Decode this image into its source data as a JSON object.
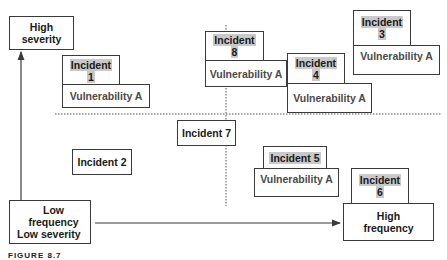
{
  "axes": {
    "y_axis_label": "High severity",
    "origin_label_line1": "Low frequency",
    "origin_label_line2": "Low severity",
    "x_axis_label_line1": "High",
    "x_axis_label_line2": "frequency"
  },
  "incidents": [
    {
      "id": "1",
      "label": "Incident",
      "number": "1",
      "vulnerability": "Vulnerability A"
    },
    {
      "id": "2",
      "label": "Incident 2"
    },
    {
      "id": "3",
      "label": "Incident",
      "number": "3",
      "vulnerability": "Vulnerability A"
    },
    {
      "id": "4",
      "label": "Incident",
      "number": "4",
      "vulnerability": "Vulnerability A"
    },
    {
      "id": "5",
      "label": "Incident 5",
      "vulnerability": "Vulnerability A"
    },
    {
      "id": "6",
      "label": "Incident",
      "number": "6"
    },
    {
      "id": "7",
      "label": "Incident 7"
    },
    {
      "id": "8",
      "label": "Incident",
      "number": "8",
      "vulnerability": "Vulnerability A"
    }
  ],
  "caption": "FIGURE 8.7",
  "colors": {
    "border": "#3a3a3a",
    "highlight": "#c9c9c9",
    "vulnerability_text": "#4a4a4a"
  }
}
